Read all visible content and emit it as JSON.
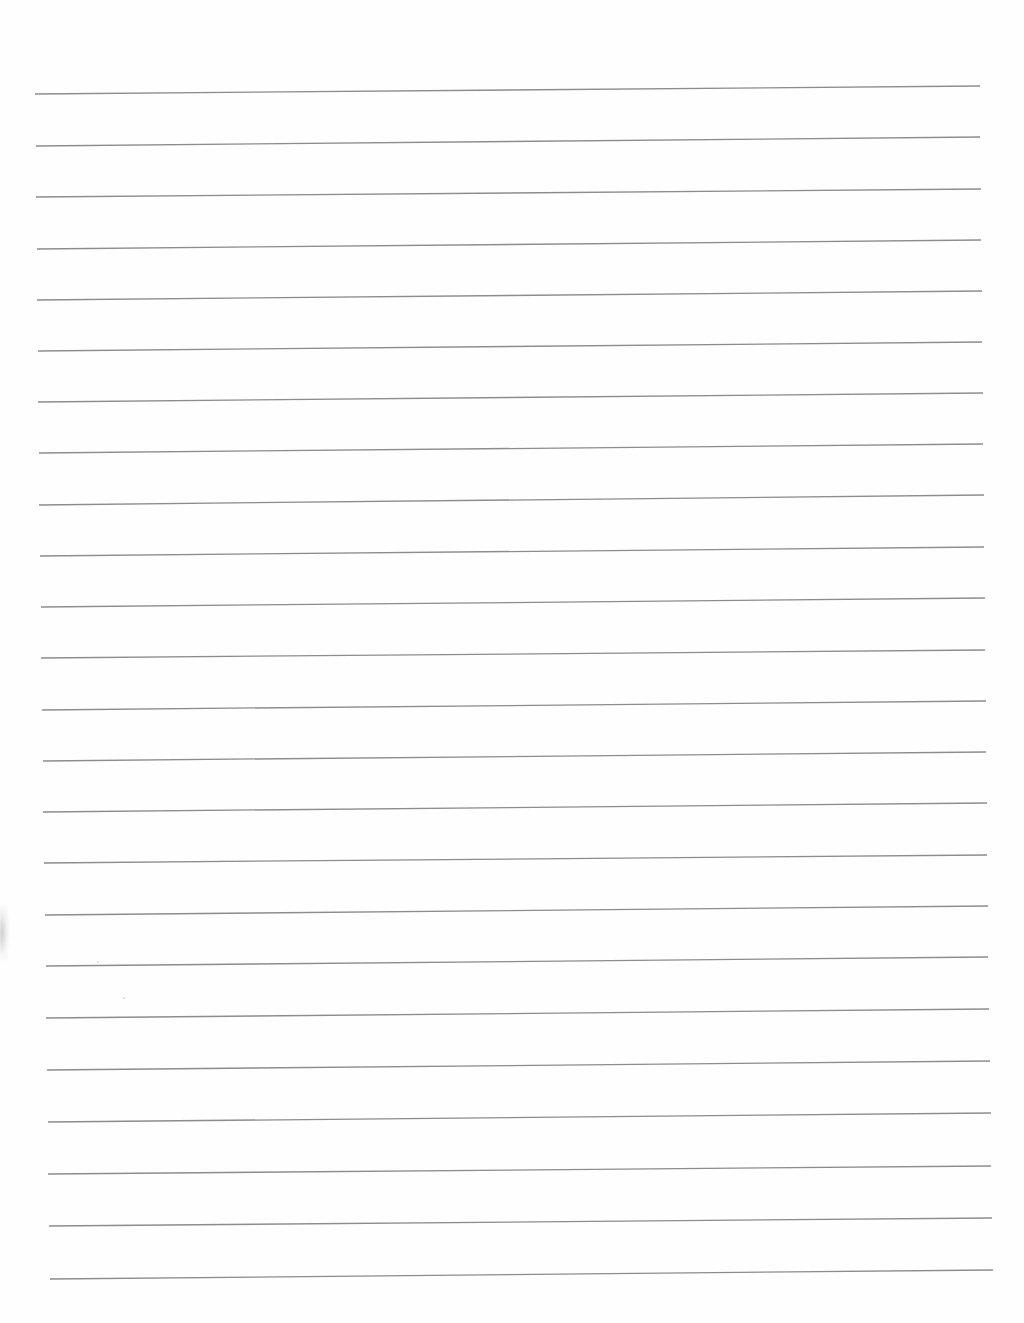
{
  "page": {
    "type": "blank lined paper (scanned)",
    "background": "#fefefe",
    "line_color": "#8c8c8c",
    "line_count": 24,
    "lines": [
      {
        "x1": 35,
        "y1": 94,
        "x2": 980,
        "y2": 86
      },
      {
        "x1": 36,
        "y1": 146,
        "x2": 980,
        "y2": 137
      },
      {
        "x1": 36,
        "y1": 197,
        "x2": 981,
        "y2": 189
      },
      {
        "x1": 37,
        "y1": 249,
        "x2": 981,
        "y2": 240
      },
      {
        "x1": 37,
        "y1": 300,
        "x2": 982,
        "y2": 291
      },
      {
        "x1": 38,
        "y1": 351,
        "x2": 982,
        "y2": 342
      },
      {
        "x1": 38,
        "y1": 402,
        "x2": 983,
        "y2": 393
      },
      {
        "x1": 39,
        "y1": 453,
        "x2": 983,
        "y2": 444
      },
      {
        "x1": 39,
        "y1": 505,
        "x2": 984,
        "y2": 495
      },
      {
        "x1": 40,
        "y1": 556,
        "x2": 984,
        "y2": 547
      },
      {
        "x1": 41,
        "y1": 607,
        "x2": 985,
        "y2": 598
      },
      {
        "x1": 41,
        "y1": 658,
        "x2": 985,
        "y2": 650
      },
      {
        "x1": 42,
        "y1": 710,
        "x2": 986,
        "y2": 701
      },
      {
        "x1": 43,
        "y1": 761,
        "x2": 986,
        "y2": 752
      },
      {
        "x1": 43,
        "y1": 812,
        "x2": 987,
        "y2": 803
      },
      {
        "x1": 44,
        "y1": 863,
        "x2": 987,
        "y2": 855
      },
      {
        "x1": 45,
        "y1": 915,
        "x2": 988,
        "y2": 906
      },
      {
        "x1": 46,
        "y1": 966,
        "x2": 988,
        "y2": 957
      },
      {
        "x1": 46,
        "y1": 1018,
        "x2": 989,
        "y2": 1009
      },
      {
        "x1": 47,
        "y1": 1070,
        "x2": 990,
        "y2": 1061
      },
      {
        "x1": 48,
        "y1": 1122,
        "x2": 991,
        "y2": 1113
      },
      {
        "x1": 48,
        "y1": 1174,
        "x2": 991,
        "y2": 1166
      },
      {
        "x1": 49,
        "y1": 1226,
        "x2": 992,
        "y2": 1218
      },
      {
        "x1": 50,
        "y1": 1279,
        "x2": 993,
        "y2": 1270
      }
    ],
    "text_content": ""
  }
}
